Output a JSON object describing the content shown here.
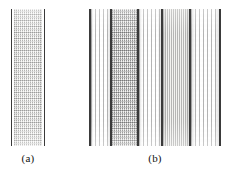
{
  "figure": {
    "background_color": "#ffffff",
    "border_color": "#3a3a3a",
    "panels": [
      {
        "id": "a",
        "caption": "(a)",
        "x": 11,
        "y": 9,
        "width": 34,
        "height": 137,
        "caption_x": 11,
        "caption_y": 152,
        "caption_width": 34,
        "bands": [
          {
            "name": "left-edge",
            "kind": "edge",
            "style": "edge",
            "width": 1,
            "color": "#3a3a3a"
          },
          {
            "name": "gap-left",
            "kind": "gap",
            "style": "blank",
            "width": 2,
            "color": "#ffffff"
          },
          {
            "name": "mesh-body",
            "kind": "fill",
            "style": "tex-mesh",
            "width": 28,
            "color": "#f7f7f5"
          },
          {
            "name": "gap-right",
            "kind": "gap",
            "style": "blank",
            "width": 2,
            "color": "#ffffff"
          },
          {
            "name": "right-edge",
            "kind": "edge",
            "style": "edge",
            "width": 1,
            "color": "#3a3a3a"
          }
        ]
      },
      {
        "id": "b",
        "caption": "(b)",
        "x": 89,
        "y": 9,
        "width": 132,
        "height": 137,
        "caption_x": 89,
        "caption_y": 152,
        "caption_width": 132,
        "bands": [
          {
            "name": "edge-1",
            "kind": "edge",
            "style": "edge",
            "width": 2,
            "color": "#3a3a3a"
          },
          {
            "name": "dash-band-1",
            "kind": "fill",
            "style": "tex-dash",
            "width": 19,
            "color": "#fdfdfd"
          },
          {
            "name": "edge-2",
            "kind": "edge",
            "style": "edge",
            "width": 2,
            "color": "#3a3a3a"
          },
          {
            "name": "mesh-band-1",
            "kind": "fill",
            "style": "tex-mesh-dense",
            "width": 25,
            "color": "#ececea"
          },
          {
            "name": "edge-3",
            "kind": "edge",
            "style": "edge",
            "width": 2,
            "color": "#3a3a3a"
          },
          {
            "name": "dash-band-2",
            "kind": "fill",
            "style": "tex-dash",
            "width": 22,
            "color": "#fdfdfd"
          },
          {
            "name": "edge-4",
            "kind": "edge",
            "style": "edge",
            "width": 2,
            "color": "#3a3a3a"
          },
          {
            "name": "line-band",
            "kind": "fill",
            "style": "tex-lines",
            "width": 26,
            "color": "#f2f2f0"
          },
          {
            "name": "edge-5",
            "kind": "edge",
            "style": "edge",
            "width": 2,
            "color": "#3a3a3a"
          },
          {
            "name": "dash-band-3",
            "kind": "fill",
            "style": "tex-dash",
            "width": 28,
            "color": "#fdfdfd"
          },
          {
            "name": "edge-6",
            "kind": "edge",
            "style": "edge",
            "width": 2,
            "color": "#3a3a3a"
          }
        ]
      }
    ]
  },
  "chart_data": {
    "type": "table",
    "title": "",
    "xlabel": "",
    "ylabel": "",
    "categories": [
      "(a)",
      "(b)"
    ],
    "series": [
      {
        "name": "band count",
        "values": [
          1,
          5
        ]
      },
      {
        "name": "boundary line count",
        "values": [
          2,
          6
        ]
      }
    ],
    "panel_a_bands": [
      {
        "label": "mesh-body",
        "texture": "checkered-mesh",
        "width_px": 28
      }
    ],
    "panel_b_bands": [
      {
        "label": "dash-band-1",
        "texture": "dashed-vertical",
        "width_px": 19
      },
      {
        "label": "mesh-band-1",
        "texture": "checkered-mesh-dense",
        "width_px": 25
      },
      {
        "label": "dash-band-2",
        "texture": "dashed-vertical",
        "width_px": 22
      },
      {
        "label": "line-band",
        "texture": "continuous-vertical-lines",
        "width_px": 26
      },
      {
        "label": "dash-band-3",
        "texture": "dashed-vertical",
        "width_px": 28
      }
    ]
  }
}
